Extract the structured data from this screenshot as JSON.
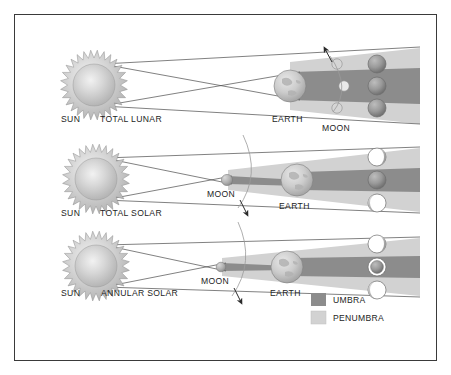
{
  "figure": {
    "background": "#ffffff",
    "border_color": "#3a3a3a"
  },
  "colors": {
    "umbra": "#8c8c8c",
    "penumbra": "#d2d2d2",
    "ray_line": "#4a4a4a",
    "earth_fill": "#cccccc",
    "sun_fill": "#c9c9c9",
    "moon_dark": "#9a9a9a",
    "moon_light": "#ffffff",
    "text": "#1d1d1d",
    "arc": "#9a9a9a",
    "arrow": "#2a2a2a"
  },
  "rows": [
    {
      "id": "total-lunar",
      "sun_label": "SUN",
      "type_label": "TOTAL LUNAR",
      "earth_label": "EARTH",
      "moon_label": "MOON",
      "phases": [
        "full-dark",
        "full-dark",
        "full-dark"
      ],
      "orbit_arrow_direction": "up"
    },
    {
      "id": "total-solar",
      "sun_label": "SUN",
      "type_label": "TOTAL SOLAR",
      "earth_label": "EARTH",
      "moon_label": "MOON",
      "phases": [
        "crescent-right",
        "full-dark",
        "crescent-left"
      ],
      "orbit_arrow_direction": "down"
    },
    {
      "id": "annular-solar",
      "sun_label": "SUN",
      "type_label": "ANNULAR  SOLAR",
      "earth_label": "EARTH",
      "moon_label": "MOON",
      "phases": [
        "crescent-right",
        "annulus",
        "crescent-left"
      ],
      "orbit_arrow_direction": "down"
    }
  ],
  "legend": {
    "items": [
      {
        "label": "UMBRA",
        "swatch": "#8c8c8c"
      },
      {
        "label": "PENUMBRA",
        "swatch": "#d2d2d2"
      }
    ]
  }
}
